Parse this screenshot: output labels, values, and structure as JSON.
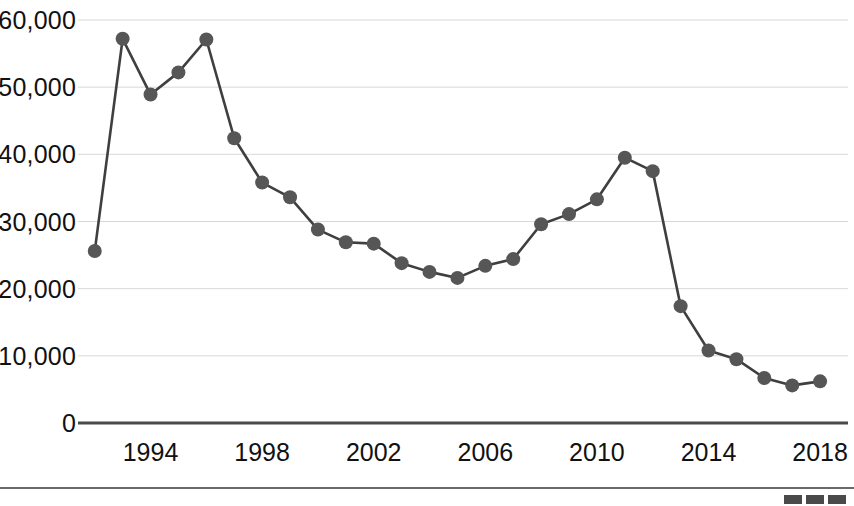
{
  "chart_data": {
    "type": "line",
    "title": "",
    "subtitle": "",
    "xlabel": "",
    "ylabel": "",
    "x": [
      1992,
      1993,
      1994,
      1995,
      1996,
      1997,
      1998,
      1999,
      2000,
      2001,
      2002,
      2003,
      2004,
      2005,
      2006,
      2007,
      2008,
      2009,
      2010,
      2011,
      2012,
      2013,
      2014,
      2015,
      2016,
      2017,
      2018
    ],
    "values": [
      25600,
      57200,
      48900,
      52200,
      57100,
      42400,
      35800,
      33600,
      28800,
      26900,
      26700,
      23800,
      22500,
      21600,
      23400,
      24400,
      29600,
      31100,
      33300,
      39500,
      37500,
      17400,
      10800,
      9500,
      6700,
      5600,
      6200
    ],
    "series": [
      {
        "name": "",
        "values": [
          25600,
          57200,
          48900,
          52200,
          57100,
          42400,
          35800,
          33600,
          28800,
          26900,
          26700,
          23800,
          22500,
          21600,
          23400,
          24400,
          29600,
          31100,
          33300,
          39500,
          37500,
          17400,
          10800,
          9500,
          6700,
          5600,
          6200
        ]
      }
    ],
    "ylim": [
      0,
      60000
    ],
    "xlim": [
      1991.4,
      2019.0
    ],
    "yticks": [
      0,
      10000,
      20000,
      30000,
      40000,
      50000,
      60000
    ],
    "ytick_labels": [
      "0",
      "10,000",
      "20,000",
      "30,000",
      "40,000",
      "50,000",
      "60,000"
    ],
    "xticks": [
      1994,
      1998,
      2002,
      2006,
      2010,
      2014,
      2018
    ],
    "xtick_labels": [
      "1994",
      "1998",
      "2002",
      "2006",
      "2010",
      "2014",
      "2018"
    ],
    "grid": true,
    "grid_axis": "y",
    "legend": null,
    "legend_position": "none",
    "marker": "circle",
    "marker_color": "#565656",
    "line_color": "#3f3f3f",
    "grid_color": "#d8d8d8",
    "baseline_color": "#4a4a4a",
    "background": "#ffffff",
    "annotations": []
  },
  "footer": {
    "source_note": "",
    "logo_blocks": [
      "block-1",
      "block-2",
      "block-3"
    ]
  }
}
